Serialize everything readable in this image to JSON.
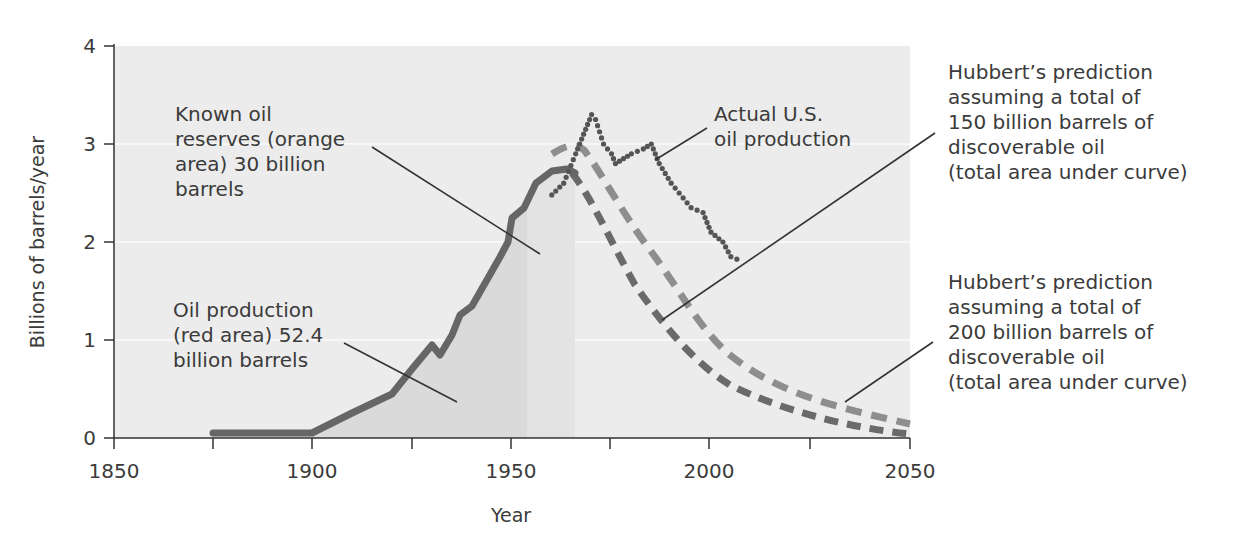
{
  "chart_data": {
    "type": "line",
    "title": "",
    "xlabel": "Year",
    "ylabel": "Billions of barrels/year",
    "xlim": [
      1850,
      2050
    ],
    "ylim": [
      0,
      4
    ],
    "x_ticks": [
      1850,
      1875,
      1900,
      1925,
      1950,
      1975,
      2000,
      2025,
      2050
    ],
    "x_tick_labels": [
      "1850",
      "",
      "1900",
      "",
      "1950",
      "",
      "2000",
      "",
      "2050"
    ],
    "y_ticks": [
      0,
      1,
      2,
      3,
      4
    ],
    "y_tick_labels": [
      "0",
      "1",
      "2",
      "3",
      "4"
    ],
    "grid": "horizontal",
    "series": [
      {
        "name": "Oil production (historical, solid)",
        "style": "solid",
        "x": [
          1875,
          1900,
          1910,
          1920,
          1925,
          1930,
          1932,
          1935,
          1937,
          1940,
          1945,
          1947,
          1949,
          1950,
          1953,
          1956,
          1960,
          1963,
          1965
        ],
        "values": [
          0.05,
          0.05,
          0.25,
          0.45,
          0.7,
          0.95,
          0.85,
          1.05,
          1.25,
          1.35,
          1.7,
          1.85,
          2.0,
          2.25,
          2.4,
          2.6,
          2.72,
          2.75,
          2.7
        ]
      },
      {
        "name": "Hubbert's prediction (150 billion barrels)",
        "style": "dashed",
        "x": [
          1965,
          1970,
          1975,
          1980,
          1985,
          1990,
          1995,
          2000,
          2010,
          2020,
          2030,
          2040,
          2050
        ],
        "values": [
          2.7,
          2.45,
          2.05,
          1.6,
          1.2,
          0.9,
          0.7,
          0.55,
          0.33,
          0.2,
          0.12,
          0.07,
          0.04
        ]
      },
      {
        "name": "Hubbert's prediction (200 billion barrels)",
        "style": "dashed-light",
        "x": [
          1962,
          1968,
          1972,
          1975,
          1980,
          1985,
          1990,
          1995,
          2000,
          2010,
          2020,
          2030,
          2040,
          2050
        ],
        "values": [
          2.9,
          3.0,
          2.85,
          2.7,
          2.4,
          2.05,
          1.7,
          1.35,
          1.05,
          0.65,
          0.42,
          0.28,
          0.2,
          0.14
        ]
      },
      {
        "name": "Actual U.S. oil production",
        "style": "dotted",
        "x": [
          1960,
          1963,
          1966,
          1968,
          1970,
          1971,
          1973,
          1975,
          1976,
          1978,
          1980,
          1983,
          1985,
          1987,
          1990,
          1992,
          1995,
          1998,
          2000,
          2003,
          2005,
          2008
        ],
        "values": [
          2.48,
          2.6,
          2.9,
          3.1,
          3.3,
          3.25,
          3.0,
          2.9,
          2.8,
          2.85,
          2.9,
          2.95,
          3.0,
          2.8,
          2.6,
          2.5,
          2.35,
          2.3,
          2.1,
          2.0,
          1.85,
          1.8
        ]
      }
    ],
    "shaded_areas": [
      {
        "name": "Oil production (red area)",
        "x_range": [
          1875,
          1954
        ],
        "total": "52.4 billion barrels"
      },
      {
        "name": "Known oil reserves (orange area)",
        "x_range": [
          1954,
          1966
        ],
        "total": "30 billion barrels"
      }
    ],
    "annotations": [
      "Known oil reserves (orange area) 30 billion barrels",
      "Oil production (red area) 52.4 billion barrels",
      "Actual U.S. oil production",
      "Hubbert's prediction assuming a total of 150 billion barrels of discoverable oil (total area under curve)",
      "Hubbert's prediction assuming a total of 200 billion barrels of discoverable oil (total area under curve)"
    ]
  },
  "labels": {
    "reserves": "Known oil\nreserves (orange\narea) 30 billion\nbarrels",
    "production": "Oil production\n(red area) 52.4\nbillion barrels",
    "actual": "Actual U.S.\noil production",
    "hubbert150": "Hubbert’s prediction\nassuming a total of\n150 billion barrels of\ndiscoverable oil\n(total area under curve)",
    "hubbert200": "Hubbert’s prediction\nassuming a total of\n200 billion barrels of\ndiscoverable oil\n(total area under curve)"
  },
  "axes": {
    "xlabel": "Year",
    "ylabel": "Billions of barrels/year",
    "x_labels": [
      "1850",
      "1900",
      "1950",
      "2000",
      "2050"
    ],
    "y_labels": [
      "0",
      "1",
      "2",
      "3",
      "4"
    ]
  },
  "colors": {
    "plot_bg": "#ececec",
    "production_fill": "#d8d8d8",
    "reserves_fill": "#e2e2e2",
    "solid_line": "#666666",
    "dashed_dark": "#6a6a6a",
    "dashed_light": "#8e8e8e",
    "dotted": "#555555",
    "axis": "#333333"
  }
}
